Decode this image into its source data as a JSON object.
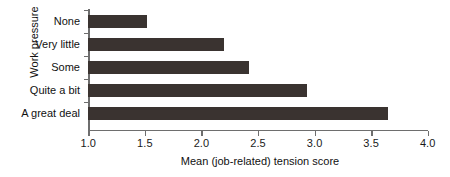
{
  "chart_data": {
    "type": "bar",
    "orientation": "horizontal",
    "title": "",
    "xlabel": "Mean (job-related) tension score",
    "ylabel": "Work pressure",
    "categories": [
      "None",
      "Very little",
      "Some",
      "Quite a bit",
      "A great deal"
    ],
    "values": [
      1.52,
      2.2,
      2.42,
      2.93,
      3.65
    ],
    "xlim": [
      1.0,
      4.0
    ],
    "xticks": [
      1.0,
      1.5,
      2.0,
      2.5,
      3.0,
      3.5,
      4.0
    ],
    "xtick_labels": [
      "1.0",
      "1.5",
      "2.0",
      "2.5",
      "3.0",
      "3.5",
      "4.0"
    ],
    "grid": false,
    "legend": false,
    "bar_color": "#3a3330",
    "axis_color": "#6e6e6e",
    "background_color": "#ffffff"
  }
}
